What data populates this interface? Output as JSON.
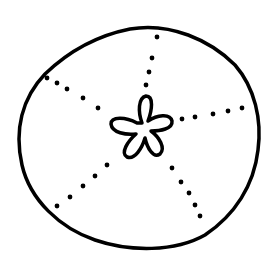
{
  "illustration": {
    "subject": "sand dollar line drawing",
    "stroke_color": "#000000",
    "background_color": "#ffffff",
    "outline": {
      "cx": 140,
      "cy": 138,
      "rx": 122,
      "ry": 110
    },
    "center_flower": {
      "cx": 142,
      "cy": 130,
      "petals": 5
    },
    "dotted_rays": 5
  }
}
